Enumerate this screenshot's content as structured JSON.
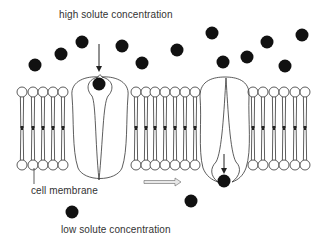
{
  "diagram": {
    "type": "facilitated diffusion through channel protein",
    "labels": {
      "top": "high solute concentration",
      "membrane": "cell membrane",
      "bottom": "low solute concentration"
    },
    "colors": {
      "solute": "#111111",
      "line": "#333333",
      "arrow_fill": "#e8e8e8",
      "background": "#ffffff"
    },
    "solutes_above": [
      {
        "x": 35,
        "y": 65
      },
      {
        "x": 61,
        "y": 54
      },
      {
        "x": 82,
        "y": 42
      },
      {
        "x": 122,
        "y": 46
      },
      {
        "x": 142,
        "y": 63
      },
      {
        "x": 177,
        "y": 50
      },
      {
        "x": 212,
        "y": 33
      },
      {
        "x": 223,
        "y": 62
      },
      {
        "x": 247,
        "y": 57
      },
      {
        "x": 267,
        "y": 42
      },
      {
        "x": 285,
        "y": 66
      },
      {
        "x": 302,
        "y": 35
      }
    ],
    "solute_in_channel_left": {
      "x": 99,
      "y": 84
    },
    "solute_exiting_right": {
      "x": 224,
      "y": 181
    },
    "solutes_below": [
      {
        "x": 72,
        "y": 212
      },
      {
        "x": 191,
        "y": 201
      }
    ],
    "lipid_groups": [
      {
        "name": "left",
        "xs": [
          22,
          33,
          43,
          53,
          63
        ]
      },
      {
        "name": "middle",
        "xs": [
          136,
          146,
          155,
          165,
          175,
          185,
          195
        ]
      },
      {
        "name": "right",
        "xs": [
          253,
          263,
          274,
          284,
          295,
          305
        ]
      }
    ],
    "channels": [
      {
        "name": "channel-open-top",
        "cx": 100,
        "state": "solute entering"
      },
      {
        "name": "channel-open-bottom",
        "cx": 225,
        "state": "solute exiting"
      }
    ],
    "process_arrow": {
      "direction": "right",
      "x1": 144,
      "x2": 181,
      "y": 182
    }
  }
}
